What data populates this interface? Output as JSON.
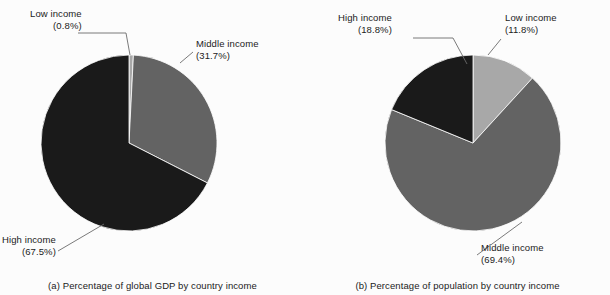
{
  "figure": {
    "background_color": "#fcfcfc",
    "text_color": "#1b1b1b"
  },
  "colors": {
    "low_income": "#a8a8a8",
    "middle_income": "#636363",
    "high_income": "#1a1a1a",
    "leader_line": "#6b6b6b",
    "slice_outline": "#ffffff"
  },
  "panels": [
    {
      "id": "a",
      "caption": "(a) Percentage of global GDP by country income",
      "labels": {
        "low": {
          "name": "Low income",
          "pct": "(0.8%)"
        },
        "middle": {
          "name": "Middle income",
          "pct": "(31.7%)"
        },
        "high": {
          "name": "High income",
          "pct": "(67.5%)"
        }
      }
    },
    {
      "id": "b",
      "caption": "(b) Percentage of population by country income",
      "labels": {
        "low": {
          "name": "Low income",
          "pct": "(11.8%)"
        },
        "middle": {
          "name": "Middle income",
          "pct": "(69.4%)"
        },
        "high": {
          "name": "High income",
          "pct": "(18.8%)"
        }
      }
    }
  ],
  "chart_data": [
    {
      "type": "pie",
      "id": "a",
      "title": "(a) Percentage of global GDP by country income",
      "categories": [
        "Low income",
        "Middle income",
        "High income"
      ],
      "values": [
        0.8,
        31.7,
        67.5
      ],
      "value_labels": [
        "(0.8%)",
        "(31.7%)",
        "(67.5%)"
      ],
      "units": "percent",
      "colors": [
        "#a8a8a8",
        "#636363",
        "#1a1a1a"
      ],
      "start_angle_deg": 0,
      "direction": "clockwise",
      "center": [
        129,
        143
      ],
      "radius": 88,
      "legend": "none",
      "labels_position": "outside-with-leader-lines"
    },
    {
      "type": "pie",
      "id": "b",
      "title": "(b) Percentage of population by country income",
      "categories": [
        "Low income",
        "Middle income",
        "High income"
      ],
      "values": [
        11.8,
        69.4,
        18.8
      ],
      "value_labels": [
        "(11.8%)",
        "(69.4%)",
        "(18.8%)"
      ],
      "units": "percent",
      "colors": [
        "#a8a8a8",
        "#636363",
        "#1a1a1a"
      ],
      "start_angle_deg": 0,
      "direction": "clockwise",
      "center": [
        168,
        143
      ],
      "radius": 88,
      "legend": "none",
      "labels_position": "outside-with-leader-lines"
    }
  ]
}
